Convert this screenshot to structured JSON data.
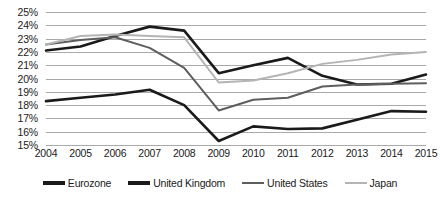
{
  "chart_data": {
    "type": "line",
    "title": "",
    "subtitle": "",
    "xlabel": "",
    "ylabel": "",
    "categories": [
      "2004",
      "2005",
      "2006",
      "2007",
      "2008",
      "2009",
      "2010",
      "2011",
      "2012",
      "2013",
      "2014",
      "2015"
    ],
    "ylim": [
      15,
      25
    ],
    "ytick_values": [
      15,
      16,
      17,
      18,
      19,
      20,
      21,
      22,
      23,
      24,
      25
    ],
    "ytick_labels": [
      "15%",
      "16%",
      "17%",
      "18%",
      "19%",
      "20%",
      "21%",
      "22%",
      "23%",
      "24%",
      "25%"
    ],
    "grid": true,
    "legend_position": "bottom",
    "series": [
      {
        "name": "Eurozone",
        "color": "#1a1a1a",
        "width": 2.6,
        "values": [
          22.1,
          22.4,
          23.2,
          23.9,
          23.6,
          20.4,
          21.0,
          21.55,
          20.2,
          19.55,
          19.6,
          20.3
        ]
      },
      {
        "name": "United Kingdom",
        "color": "#1a1a1a",
        "width": 2.6,
        "values": [
          18.3,
          18.55,
          18.8,
          19.15,
          18.0,
          15.3,
          16.4,
          16.2,
          16.25,
          16.9,
          17.55,
          17.5
        ]
      },
      {
        "name": "United States",
        "color": "#5e5e5e",
        "width": 2.0,
        "values": [
          22.55,
          22.9,
          23.1,
          22.3,
          20.8,
          17.6,
          18.4,
          18.55,
          19.4,
          19.55,
          19.6,
          19.65
        ]
      },
      {
        "name": "Japan",
        "color": "#b4b4b4",
        "width": 2.0,
        "values": [
          22.55,
          23.2,
          23.3,
          23.2,
          23.1,
          19.7,
          19.85,
          20.4,
          21.1,
          21.4,
          21.8,
          22.0
        ]
      }
    ]
  },
  "legend": {
    "items": [
      {
        "label": "Eurozone",
        "color": "#1a1a1a",
        "width": 3.4
      },
      {
        "label": "United Kingdom",
        "color": "#1a1a1a",
        "width": 3.4
      },
      {
        "label": "United States",
        "color": "#5e5e5e",
        "width": 2.6
      },
      {
        "label": "Japan",
        "color": "#b4b4b4",
        "width": 2.4
      }
    ]
  },
  "colors": {
    "gridline": "#aaaaaa",
    "text": "#1a1a1a",
    "background": "#ffffff"
  }
}
